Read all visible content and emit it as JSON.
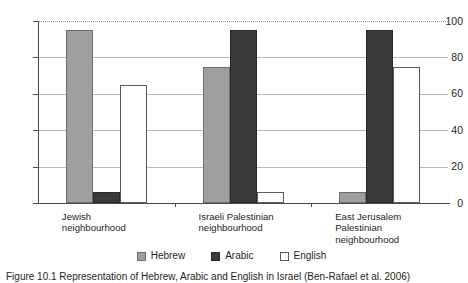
{
  "chart_data": {
    "type": "bar",
    "title": "",
    "subtitle": "",
    "xlabel": "",
    "ylabel": "",
    "ylim": [
      0,
      100
    ],
    "yticks": [
      0,
      20,
      40,
      60,
      80,
      100
    ],
    "ytick_labels": [
      "0",
      "20",
      "40",
      "60",
      "80",
      "100"
    ],
    "grid": true,
    "legend_position": "bottom-center",
    "categories": [
      "Jewish\nneighbourhood",
      "Israeli Palestinian\nneighbourhood",
      "East Jerusalem\nPalestinian\nneighbourhood"
    ],
    "series": [
      {
        "name": "Hebrew",
        "color": "#9f9f9f",
        "values": [
          95,
          75,
          6
        ]
      },
      {
        "name": "Arabic",
        "color": "#3a3a3a",
        "values": [
          6,
          95,
          95
        ]
      },
      {
        "name": "English",
        "color": "#ffffff",
        "values": [
          65,
          6,
          75
        ]
      }
    ]
  },
  "legend": {
    "items": [
      {
        "label": "Hebrew",
        "swatch": "hebrew"
      },
      {
        "label": "Arabic",
        "swatch": "arabic"
      },
      {
        "label": "English",
        "swatch": "english"
      }
    ]
  },
  "caption": {
    "text": "Figure 10.1 Representation of Hebrew, Arabic and English in Israel (Ben-Rafael et al. 2006)"
  }
}
